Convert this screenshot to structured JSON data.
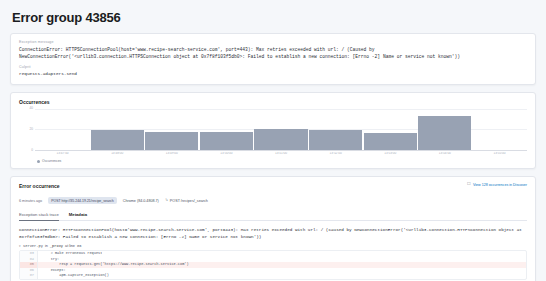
{
  "page": {
    "title": "Error group 43856"
  },
  "exception_panel": {
    "message_label": "Exception message",
    "message": "ConnectionError: HTTPSConnectionPool(host='www.recipe-search-service.com', port=443): Max retries exceeded with url: / (Caused by NewConnectionError('<urllib3.connection.HTTPSConnection object at 0x7f8f103f5db0>: Failed to establish a new connection: [Errno -2] Name or service not known'))",
    "culprit_label": "Culprit",
    "culprit": "requests.adapters.send"
  },
  "occurrences": {
    "title": "Occurrences",
    "legend_label": "Occurrences",
    "legend_color": "#98a2b3"
  },
  "chart_data": {
    "type": "bar",
    "title": "Occurrences",
    "xlabel": "",
    "ylabel": "",
    "ylim": [
      0,
      40
    ],
    "yticks": [
      0,
      20,
      40
    ],
    "ytick_labels": [
      "0",
      "20",
      "40"
    ],
    "grid": true,
    "legend_position": "bottom-left",
    "categories": [
      "13:47:00",
      "13:48:00",
      "13:49:00",
      "13:50:00",
      "13:51:00",
      "13:52:00",
      "13:53:00",
      "13:54:00",
      "13:55:00"
    ],
    "series": [
      {
        "name": "Occurrences",
        "color": "#98a2b3",
        "values": [
          0,
          19,
          17,
          17,
          20,
          19,
          16,
          33,
          0
        ]
      }
    ]
  },
  "error_occurrence": {
    "title": "Error occurrence",
    "discover_link": "View 128 occurrences in Discover",
    "discover_icon": "external-link-icon",
    "time_ago": "6 minutes ago",
    "url_badge": "POST http://35.244.19.21/recipe_search",
    "browser": "Chrome (84.0.4808.7)",
    "transaction_icon": "transaction-icon",
    "transaction": "POST /recipes/_search",
    "tabs": [
      {
        "label": "Exception stack trace",
        "active": true
      },
      {
        "label": "Metadata",
        "active": false
      }
    ]
  },
  "stack_trace": {
    "message": "ConnectionError: HTTPSConnectionPool(host='www.recipe-search-service.com', port=443): Max retries exceeded with url: / (Caused by NewConnectionError('<urllib3.connection.HTTPSConnection object at 0x7f8f103f5db0>: Failed to establish a new connection: [Errno -2] Name or service not known'))",
    "frame": {
      "chevron": "chevron-down-icon",
      "file": "server.py",
      "in_word": "in",
      "function": "_proxy",
      "at_word": "at line",
      "line": "86"
    },
    "code_lines": [
      {
        "num": "83",
        "text": "    # make erroneous request"
      },
      {
        "num": "84",
        "text": "    try:"
      },
      {
        "num": "85",
        "text": "        resp = requests.get('https://www.recipe-search-service.com')",
        "highlight": true
      },
      {
        "num": "86",
        "text": "    except:"
      },
      {
        "num": "87",
        "text": "        apm.capture_exception()"
      }
    ],
    "local_vars_label": "Local variables",
    "local_vars_icon": "chevron-right-icon"
  }
}
